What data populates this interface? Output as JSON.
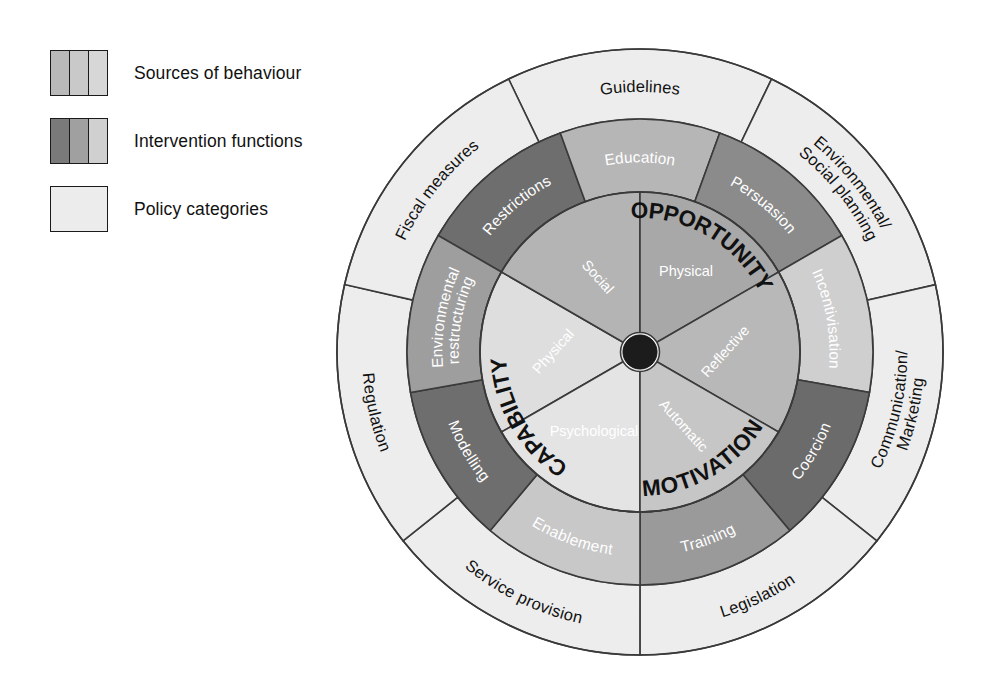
{
  "legend": {
    "items": [
      {
        "label": "Sources of behaviour",
        "swatch": [
          "#b9b9b9",
          "#c9c9c9",
          "#d7d7d7"
        ]
      },
      {
        "label": "Intervention functions",
        "swatch": [
          "#7a7a7a",
          "#a0a0a0",
          "#d0d0d0"
        ]
      },
      {
        "label": "Policy categories",
        "swatch": [
          "#ececec"
        ]
      }
    ]
  },
  "wheel": {
    "hub_color": "#1c1c1c",
    "sources": {
      "groups": [
        {
          "label": "CAPABILITY",
          "color": "#d9d9d9"
        },
        {
          "label": "OPPORTUNITY",
          "color": "#b0b0b0"
        },
        {
          "label": "MOTIVATION",
          "color": "#c4c4c4"
        }
      ],
      "components": [
        {
          "label": "Physical",
          "group": "CAPABILITY",
          "color": "#dedede"
        },
        {
          "label": "Psychological",
          "group": "CAPABILITY",
          "color": "#e4e4e4"
        },
        {
          "label": "Social",
          "group": "OPPORTUNITY",
          "color": "#b4b4b4"
        },
        {
          "label": "Physical",
          "group": "OPPORTUNITY",
          "color": "#a8a8a8"
        },
        {
          "label": "Reflective",
          "group": "MOTIVATION",
          "color": "#b8b8b8"
        },
        {
          "label": "Automatic",
          "group": "MOTIVATION",
          "color": "#c6c6c6"
        }
      ]
    },
    "intervention_functions": [
      {
        "label": "Restrictions",
        "color": "#6e6e6e",
        "text": "#ffffff"
      },
      {
        "label": "Education",
        "color": "#b6b6b6",
        "text": "#ffffff"
      },
      {
        "label": "Persuasion",
        "color": "#8b8b8b",
        "text": "#ffffff"
      },
      {
        "label": "Incentivisation",
        "color": "#cfcfcf",
        "text": "#ffffff"
      },
      {
        "label": "Coercion",
        "color": "#6b6b6b",
        "text": "#ffffff"
      },
      {
        "label": "Training",
        "color": "#9a9a9a",
        "text": "#ffffff"
      },
      {
        "label": "Enablement",
        "color": "#c8c8c8",
        "text": "#ffffff"
      },
      {
        "label": "Modelling",
        "color": "#6e6e6e",
        "text": "#ffffff"
      },
      {
        "label": "Environmental\nrestructuring",
        "color": "#9e9e9e",
        "text": "#ffffff"
      }
    ],
    "policy_categories": [
      {
        "label": "Guidelines",
        "color": "#ededed",
        "text": "#111111"
      },
      {
        "label": "Environmental/\nSocial planning",
        "color": "#ededed",
        "text": "#111111"
      },
      {
        "label": "Communication/\nMarketing",
        "color": "#ededed",
        "text": "#111111"
      },
      {
        "label": "Legislation",
        "color": "#ededed",
        "text": "#111111"
      },
      {
        "label": "Service provision",
        "color": "#ededed",
        "text": "#111111"
      },
      {
        "label": "Regulation",
        "color": "#ededed",
        "text": "#111111"
      },
      {
        "label": "Fiscal measures",
        "color": "#ededed",
        "text": "#111111"
      }
    ]
  },
  "chart_data": {
    "type": "pie",
    "rings": [
      {
        "name": "Sources of behaviour (inner)",
        "categories": [
          "Physical (Capability)",
          "Psychological (Capability)",
          "Social (Opportunity)",
          "Physical (Opportunity)",
          "Reflective (Motivation)",
          "Automatic (Motivation)"
        ],
        "values": [
          60,
          60,
          60,
          60,
          60
        ]
      },
      {
        "name": "Intervention functions (middle)",
        "categories": [
          "Education",
          "Persuasion",
          "Incentivisation",
          "Coercion",
          "Training",
          "Enablement",
          "Modelling",
          "Environmental restructuring",
          "Restrictions"
        ],
        "values": [
          40,
          40,
          40,
          40,
          40,
          40,
          40,
          40,
          40
        ]
      },
      {
        "name": "Policy categories (outer)",
        "categories": [
          "Environmental/Social planning",
          "Communication/Marketing",
          "Legislation",
          "Service provision",
          "Regulation",
          "Fiscal measures",
          "Guidelines"
        ],
        "values": [
          51.4,
          51.4,
          51.4,
          51.4,
          51.4,
          51.4,
          51.4
        ]
      }
    ],
    "legend": [
      "Sources of behaviour",
      "Intervention functions",
      "Policy categories"
    ],
    "legend_position": "top-left"
  }
}
